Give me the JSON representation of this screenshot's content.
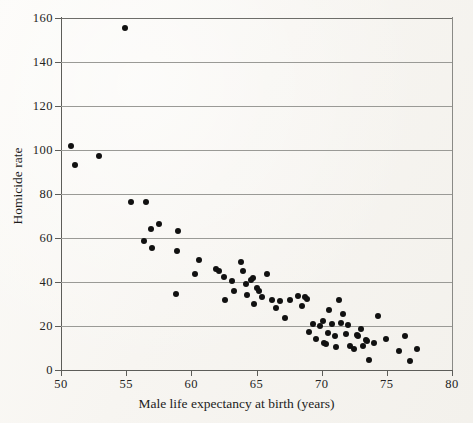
{
  "figure": {
    "background_color": "#fbfaf7",
    "point_color": "#111111",
    "grid_color": "#9a9a96",
    "axis_color": "#5d5d59"
  },
  "axes": {
    "x_title": "Male life expectancy at birth (years)",
    "y_title": "Homicide rate",
    "x_ticks": [
      "50",
      "55",
      "60",
      "65",
      "70",
      "75",
      "80"
    ],
    "y_ticks": [
      "0",
      "20",
      "40",
      "60",
      "80",
      "100",
      "120",
      "140",
      "160"
    ]
  },
  "chart_data": {
    "type": "scatter",
    "title": "",
    "xlabel": "Male life expectancy at birth (years)",
    "ylabel": "Homicide rate",
    "xlim": [
      50,
      80
    ],
    "ylim": [
      0,
      160
    ],
    "x_tick_values": [
      50,
      55,
      60,
      65,
      70,
      75,
      80
    ],
    "y_tick_values": [
      0,
      20,
      40,
      60,
      80,
      100,
      120,
      140,
      160
    ],
    "grid": "horizontal",
    "legend": null,
    "marker": "filled-circle",
    "marker_color": "#111111",
    "points": [
      [
        50.8,
        102.0
      ],
      [
        51.1,
        93.0
      ],
      [
        52.9,
        97.5
      ],
      [
        54.9,
        155.5
      ],
      [
        55.4,
        76.5
      ],
      [
        56.5,
        76.5
      ],
      [
        56.4,
        58.5
      ],
      [
        56.9,
        64.0
      ],
      [
        57.0,
        55.5
      ],
      [
        57.5,
        66.5
      ],
      [
        59.0,
        63.0
      ],
      [
        58.9,
        54.0
      ],
      [
        58.8,
        34.5
      ],
      [
        60.3,
        43.5
      ],
      [
        60.6,
        50.0
      ],
      [
        61.9,
        46.0
      ],
      [
        62.1,
        45.0
      ],
      [
        62.5,
        42.5
      ],
      [
        62.6,
        32.0
      ],
      [
        63.1,
        40.5
      ],
      [
        63.3,
        36.0
      ],
      [
        63.8,
        49.0
      ],
      [
        64.0,
        45.0
      ],
      [
        64.2,
        39.0
      ],
      [
        64.3,
        34.0
      ],
      [
        64.6,
        41.0
      ],
      [
        64.7,
        42.0
      ],
      [
        64.8,
        30.0
      ],
      [
        65.0,
        37.5
      ],
      [
        65.2,
        36.0
      ],
      [
        65.4,
        33.0
      ],
      [
        65.8,
        43.5
      ],
      [
        66.2,
        32.0
      ],
      [
        66.5,
        28.0
      ],
      [
        66.8,
        31.5
      ],
      [
        67.2,
        23.5
      ],
      [
        67.6,
        32.0
      ],
      [
        68.2,
        33.5
      ],
      [
        68.5,
        29.0
      ],
      [
        68.7,
        33.0
      ],
      [
        68.9,
        32.5
      ],
      [
        69.0,
        17.5
      ],
      [
        69.3,
        21.0
      ],
      [
        69.6,
        14.0
      ],
      [
        69.9,
        20.0
      ],
      [
        70.1,
        22.5
      ],
      [
        70.2,
        12.5
      ],
      [
        70.3,
        12.0
      ],
      [
        70.5,
        17.0
      ],
      [
        70.6,
        27.5
      ],
      [
        70.8,
        21.0
      ],
      [
        71.0,
        15.5
      ],
      [
        71.1,
        10.5
      ],
      [
        71.3,
        32.0
      ],
      [
        71.5,
        21.5
      ],
      [
        71.6,
        25.5
      ],
      [
        71.9,
        16.5
      ],
      [
        72.0,
        20.5
      ],
      [
        72.2,
        11.0
      ],
      [
        72.5,
        9.5
      ],
      [
        72.7,
        16.0
      ],
      [
        72.8,
        15.5
      ],
      [
        73.0,
        18.5
      ],
      [
        73.2,
        11.0
      ],
      [
        73.4,
        13.5
      ],
      [
        73.5,
        13.0
      ],
      [
        73.6,
        4.5
      ],
      [
        74.0,
        12.5
      ],
      [
        74.3,
        24.5
      ],
      [
        74.9,
        14.0
      ],
      [
        75.9,
        8.5
      ],
      [
        76.4,
        15.5
      ],
      [
        76.8,
        4.0
      ],
      [
        77.3,
        9.5
      ]
    ]
  }
}
